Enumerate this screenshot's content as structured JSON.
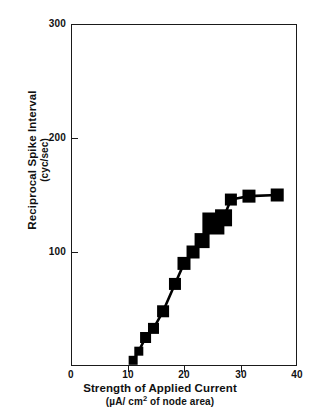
{
  "chart_data": {
    "type": "line",
    "title": "",
    "xlabel": "Strength of Applied Current",
    "xlabel_units": "(µA/ cm² of node area)",
    "ylabel": "Reciprocal Spike Interval",
    "ylabel_units": "(cyc/sec)",
    "xlim": [
      0,
      40
    ],
    "ylim": [
      0,
      300
    ],
    "xticks": [
      0,
      10,
      20,
      30,
      40
    ],
    "yticks": [
      0,
      100,
      200,
      300
    ],
    "xtick_labels": [
      "0",
      "10",
      "20",
      "30",
      "40"
    ],
    "ytick_labels": [
      "0",
      "100",
      "200",
      "300"
    ],
    "grid": false,
    "legend": null,
    "marker": "square",
    "marker_color": "#000000",
    "line_color": "#000000",
    "x": [
      11,
      12,
      13.2,
      14.6,
      16.3,
      18.4,
      20,
      21.6,
      23.2,
      25.2,
      27,
      28.3,
      31.5,
      36.5
    ],
    "y": [
      5,
      13,
      25,
      33,
      48,
      72,
      90,
      100,
      110,
      125,
      130,
      146,
      149,
      150
    ],
    "marker_sizes": [
      9,
      9,
      11,
      11,
      12,
      12,
      13,
      13,
      15,
      22,
      17,
      12,
      13,
      13
    ]
  },
  "axis": {
    "y_tick_300": "300",
    "y_tick_200": "200",
    "y_tick_100": "100",
    "x_tick_0": "0",
    "x_tick_10": "10",
    "x_tick_20": "20",
    "x_tick_30": "30",
    "x_tick_40": "40"
  },
  "labels": {
    "y_title": "Reciprocal Spike Interval",
    "y_subtitle": "(cyc/sec)",
    "x_title": "Strength of Applied Current",
    "x_subtitle_prefix": "(µA/ cm",
    "x_subtitle_sup": "2",
    "x_subtitle_suffix": " of node area)"
  },
  "colors": {
    "ink": "#1a1a1a",
    "marker": "#000000",
    "background": "#ffffff"
  }
}
